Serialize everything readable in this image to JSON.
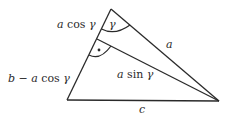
{
  "diagram": {
    "type": "triangle-with-altitude",
    "vertices": {
      "top": [
        111,
        9
      ],
      "bottom_left": [
        67,
        100
      ],
      "right": [
        219,
        101
      ],
      "altitude_foot": [
        97,
        39
      ]
    },
    "labels": {
      "upper_left_segment": {
        "var": "a",
        "func": "cos",
        "angle": "γ"
      },
      "lower_left_segment": {
        "b": "b",
        "minus": "−",
        "var": "a",
        "func": "cos",
        "angle": "γ"
      },
      "side_a": "a",
      "altitude": {
        "var": "a",
        "func": "sin",
        "angle": "γ"
      },
      "side_c": "c",
      "angle_gamma": "γ",
      "right_angle_marker": "•"
    },
    "colors": {
      "line": "#2a2a2a",
      "background": "#ffffff"
    }
  }
}
